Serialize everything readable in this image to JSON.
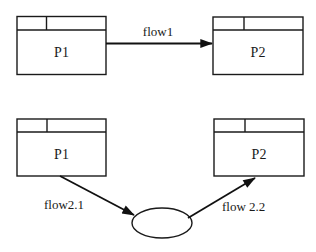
{
  "diagram": {
    "type": "data-flow",
    "colors": {
      "stroke": "#1a1a1a",
      "background": "#ffffff"
    },
    "top_row": {
      "source": {
        "label": "P1"
      },
      "target": {
        "label": "P2"
      },
      "flow": {
        "label": "flow1"
      }
    },
    "bottom_row": {
      "source": {
        "label": "P1"
      },
      "target": {
        "label": "P2"
      },
      "store": {
        "label": ""
      },
      "flow_in": {
        "label": "flow2.1"
      },
      "flow_out": {
        "label": "flow 2.2"
      }
    }
  }
}
